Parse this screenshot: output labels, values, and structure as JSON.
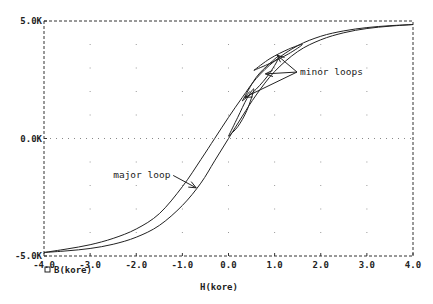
{
  "chart_data": {
    "type": "line",
    "title": "",
    "xlabel": "H(kore)",
    "ylabel": "",
    "legend": [
      {
        "marker": "square",
        "label": "B(kore)"
      }
    ],
    "legend_position": "bottom-left",
    "xlim": [
      -4.0,
      4.0
    ],
    "ylim": [
      -5.0,
      5.0
    ],
    "x_ticks": [
      "-4.0",
      "-3.0",
      "-2.0",
      "-1.0",
      "0.0",
      "1.0",
      "2.0",
      "3.0",
      "4.0"
    ],
    "y_ticks": [
      "5.0K",
      "0.0K",
      "-5.0K"
    ],
    "grid": "dotted",
    "series": [
      {
        "name": "major loop (ascending branch)",
        "x": [
          -4.0,
          -3.5,
          -3.0,
          -2.5,
          -2.0,
          -1.5,
          -1.0,
          -0.6,
          -0.3,
          0.0,
          0.3,
          0.6,
          1.0,
          1.5,
          2.0,
          2.5,
          3.0,
          3.5,
          4.0
        ],
        "y": [
          -4.85,
          -4.78,
          -4.68,
          -4.5,
          -4.2,
          -3.7,
          -2.85,
          -1.9,
          -0.95,
          0.0,
          0.95,
          1.85,
          2.85,
          3.7,
          4.2,
          4.5,
          4.68,
          4.78,
          4.85
        ]
      },
      {
        "name": "major loop (descending branch)",
        "x": [
          4.0,
          3.5,
          3.0,
          2.5,
          2.0,
          1.5,
          1.0,
          0.6,
          0.3,
          0.0,
          -0.3,
          -0.6,
          -1.0,
          -1.5,
          -2.0,
          -2.5,
          -3.0,
          -3.5,
          -4.0
        ],
        "y": [
          4.85,
          4.8,
          4.72,
          4.58,
          4.35,
          3.95,
          3.3,
          2.55,
          1.75,
          0.9,
          0.0,
          -0.9,
          -2.05,
          -3.2,
          -3.85,
          -4.25,
          -4.52,
          -4.7,
          -4.85
        ]
      },
      {
        "name": "minor loop 1",
        "x": [
          0.0,
          0.2,
          0.4,
          0.55,
          0.4,
          0.2,
          0.0
        ],
        "y": [
          0.1,
          0.9,
          1.7,
          2.1,
          1.2,
          0.5,
          0.1
        ]
      },
      {
        "name": "minor loop 2",
        "x": [
          0.3,
          0.6,
          0.9,
          1.1,
          0.9,
          0.6,
          0.3
        ],
        "y": [
          1.6,
          2.6,
          3.2,
          3.5,
          2.8,
          2.1,
          1.6
        ]
      },
      {
        "name": "minor loop 3",
        "x": [
          0.55,
          0.9,
          1.3,
          1.6,
          1.3,
          0.9,
          0.55
        ],
        "y": [
          2.9,
          3.4,
          3.8,
          4.0,
          3.6,
          3.2,
          2.9
        ]
      }
    ],
    "annotations": [
      {
        "text": "major loop",
        "text_at": [
          -2.5,
          -1.7
        ],
        "arrow_to": [
          -0.7,
          -2.1
        ]
      },
      {
        "text": "minor loops",
        "text_at": [
          1.55,
          2.7
        ],
        "arrow_to": [
          [
            1.05,
            3.55
          ],
          [
            0.8,
            2.75
          ],
          [
            0.35,
            1.75
          ]
        ]
      }
    ]
  },
  "labels": {
    "x_axis_title": "H(kore)",
    "legend_label": "B(kore)",
    "annot_major": "major loop",
    "annot_minor": "minor loops"
  }
}
